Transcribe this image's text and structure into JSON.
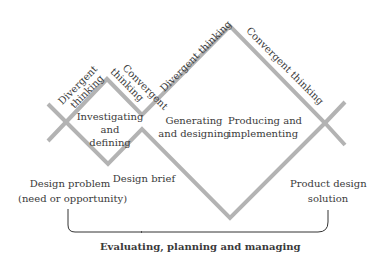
{
  "diagram": {
    "line_color": "#b3b3b3",
    "bracket_color": "#333333",
    "phase_labels": [
      {
        "id": "divergent-1",
        "lines": [
          "Divergent",
          "thinking"
        ]
      },
      {
        "id": "convergent-1",
        "lines": [
          "Convergent",
          "thinking"
        ]
      },
      {
        "id": "divergent-2",
        "text": "Divergent thinking"
      },
      {
        "id": "convergent-2",
        "text": "Convergent thinking"
      }
    ],
    "stages": {
      "investigating": [
        "Investigating",
        "and",
        "defining"
      ],
      "generating": [
        "Generating",
        "and designing"
      ],
      "producing": [
        "Producing and",
        "implementing"
      ]
    },
    "milestones": {
      "design_problem": [
        "Design problem",
        "(need or opportunity)"
      ],
      "design_brief": "Design brief",
      "product_solution": [
        "Product design",
        "solution"
      ]
    },
    "footer": "Evaluating, planning and managing"
  }
}
